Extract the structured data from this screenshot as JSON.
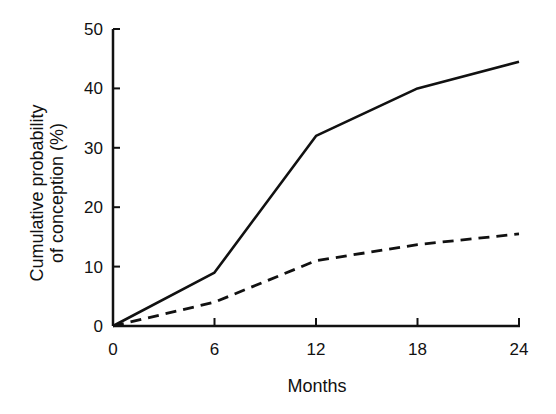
{
  "chart_data": {
    "type": "line",
    "title": "",
    "xlabel": "Months",
    "ylabel": [
      "Cumulative probability",
      "of conception (%)"
    ],
    "x": [
      0,
      6,
      12,
      18,
      24
    ],
    "xticks": [
      "0",
      "6",
      "12",
      "18",
      "24"
    ],
    "yticks": [
      "0",
      "10",
      "20",
      "30",
      "40",
      "50"
    ],
    "xlim": [
      0,
      24
    ],
    "ylim": [
      0,
      50
    ],
    "grid": false,
    "legend": null,
    "series": [
      {
        "name": "solid line",
        "style": "solid",
        "values": [
          0,
          9,
          32,
          40,
          44.5
        ]
      },
      {
        "name": "dashed line",
        "style": "dashed",
        "values": [
          0,
          4,
          11,
          13.7,
          15.5
        ]
      }
    ]
  }
}
